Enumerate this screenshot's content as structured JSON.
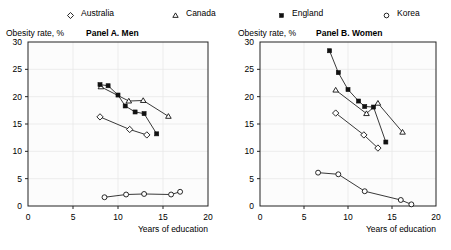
{
  "legend": {
    "items": [
      {
        "label": "Australia",
        "marker": "diamond-open-marker",
        "x": 66
      },
      {
        "label": "Canada",
        "marker": "triangle-open-marker",
        "x": 171
      },
      {
        "label": "England",
        "marker": "square-filled-marker",
        "x": 277
      },
      {
        "label": "Korea",
        "marker": "circle-open-marker",
        "x": 382
      }
    ]
  },
  "chart_data": [
    {
      "id": "panel-a",
      "type": "scatter",
      "title": "Panel A. Men",
      "ylabel": "Obesity rate, %",
      "xlabel": "Years of education",
      "xlim": [
        0,
        20
      ],
      "ylim": [
        0,
        30
      ],
      "xticks": [
        0,
        5,
        10,
        15,
        20
      ],
      "yticks": [
        0,
        5,
        10,
        15,
        20,
        25,
        30
      ],
      "grid": true,
      "legend_position": "top",
      "series": [
        {
          "name": "Australia",
          "marker": "diamond-open-marker",
          "points": [
            [
              8.0,
              16.3
            ],
            [
              11.3,
              14.0
            ],
            [
              13.2,
              13.0
            ]
          ]
        },
        {
          "name": "Canada",
          "marker": "triangle-open-marker",
          "points": [
            [
              8.1,
              21.8
            ],
            [
              11.2,
              19.2
            ],
            [
              12.8,
              19.3
            ],
            [
              15.6,
              16.4
            ]
          ]
        },
        {
          "name": "England",
          "marker": "square-filled-marker",
          "points": [
            [
              8.0,
              22.2
            ],
            [
              8.9,
              22.0
            ],
            [
              10.0,
              20.3
            ],
            [
              10.8,
              18.3
            ],
            [
              11.9,
              17.2
            ],
            [
              12.9,
              16.9
            ],
            [
              14.3,
              13.2
            ]
          ]
        },
        {
          "name": "Korea",
          "marker": "circle-open-marker",
          "points": [
            [
              8.5,
              1.6
            ],
            [
              10.9,
              2.1
            ],
            [
              12.9,
              2.2
            ],
            [
              15.9,
              2.1
            ],
            [
              16.9,
              2.6
            ]
          ]
        }
      ]
    },
    {
      "id": "panel-b",
      "type": "scatter",
      "title": "Panel B. Women",
      "ylabel": "Obesity rate, %",
      "xlabel": "Years of education",
      "xlim": [
        0,
        20
      ],
      "ylim": [
        0,
        30
      ],
      "xticks": [
        0,
        5,
        10,
        15,
        20
      ],
      "yticks": [
        0,
        5,
        10,
        15,
        20,
        25,
        30
      ],
      "grid": true,
      "legend_position": "top",
      "series": [
        {
          "name": "Australia",
          "marker": "diamond-open-marker",
          "points": [
            [
              8.6,
              17.0
            ],
            [
              11.8,
              13.0
            ],
            [
              13.4,
              10.6
            ]
          ]
        },
        {
          "name": "Canada",
          "marker": "triangle-open-marker",
          "points": [
            [
              8.6,
              21.2
            ],
            [
              12.1,
              16.9
            ],
            [
              13.4,
              18.8
            ],
            [
              16.2,
              13.5
            ]
          ]
        },
        {
          "name": "England",
          "marker": "square-filled-marker",
          "points": [
            [
              7.9,
              28.4
            ],
            [
              8.9,
              24.4
            ],
            [
              10.0,
              21.3
            ],
            [
              11.2,
              19.2
            ],
            [
              11.9,
              18.2
            ],
            [
              12.9,
              18.1
            ],
            [
              14.3,
              11.7
            ]
          ]
        },
        {
          "name": "Korea",
          "marker": "circle-open-marker",
          "points": [
            [
              6.6,
              6.1
            ],
            [
              8.9,
              5.8
            ],
            [
              11.9,
              2.7
            ],
            [
              16.0,
              1.1
            ],
            [
              17.2,
              0.3
            ]
          ]
        }
      ]
    }
  ]
}
